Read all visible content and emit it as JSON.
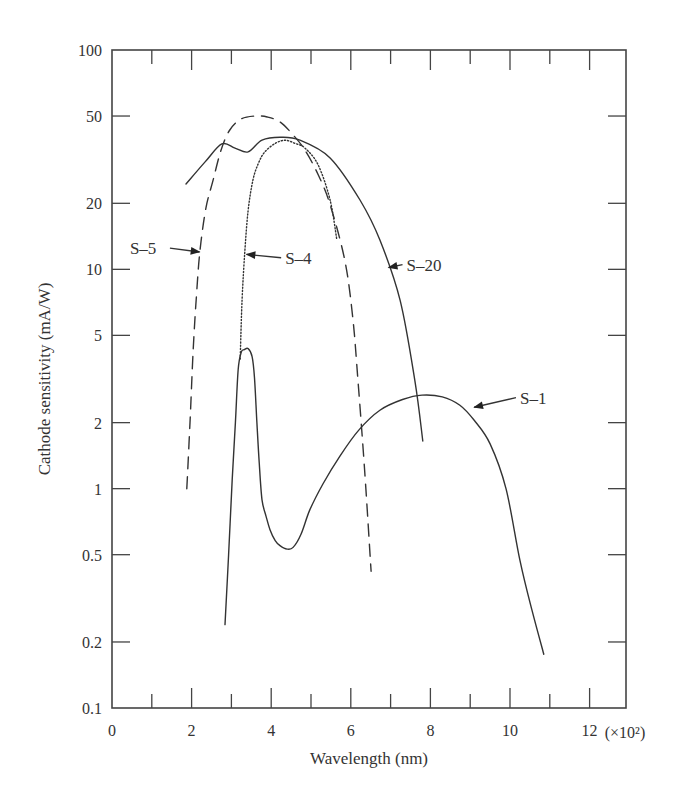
{
  "chart_data": {
    "type": "line",
    "title": "",
    "xlabel": "Wavelength (nm)",
    "x_multiplier_label": "(×10²)",
    "ylabel": "Cathode sensitivity (mA/W)",
    "xlim": [
      0,
      12.8
    ],
    "ylim": [
      0.1,
      100
    ],
    "yscale": "log",
    "grid": false,
    "x_ticks": [
      0,
      2,
      4,
      6,
      8,
      10,
      12
    ],
    "x_tick_labels": [
      "0",
      "2",
      "4",
      "6",
      "8",
      "10",
      "12"
    ],
    "x_minor_ticks": [
      1,
      3,
      5,
      7,
      9,
      11
    ],
    "y_ticks": [
      0.1,
      0.2,
      0.5,
      1,
      2,
      5,
      10,
      20,
      50,
      100
    ],
    "y_tick_labels": [
      "0.1",
      "0.2",
      "0.5",
      "1",
      "2",
      "5",
      "10",
      "20",
      "50",
      "100"
    ],
    "series": [
      {
        "name": "S-20",
        "style": "solid",
        "x": [
          1.86,
          2.34,
          2.76,
          3.09,
          3.42,
          3.77,
          4.22,
          4.72,
          5.48,
          6.23,
          6.73,
          7.24,
          7.61,
          7.81
        ],
        "values": [
          24.5,
          30.9,
          37.3,
          35.7,
          34.3,
          38.8,
          40.0,
          38.8,
          32.2,
          20.7,
          13.6,
          7.2,
          3.1,
          1.65
        ],
        "label_pos": [
          7.4,
          10.5
        ],
        "arrow_to": [
          6.95,
          10.2
        ]
      },
      {
        "name": "S-5",
        "style": "dashed",
        "x": [
          1.88,
          1.96,
          2.04,
          2.12,
          2.21,
          2.36,
          2.54,
          2.74,
          2.96,
          3.25,
          3.59,
          3.9,
          4.22,
          4.55,
          4.85,
          5.18,
          5.48,
          5.85,
          6.05,
          6.18,
          6.35,
          6.51
        ],
        "values": [
          1.0,
          2.0,
          4.3,
          7.5,
          12.2,
          19.0,
          25.5,
          35.0,
          43.2,
          48.5,
          50.0,
          49.5,
          47.0,
          41.0,
          34.9,
          27.0,
          19.7,
          11.0,
          6.0,
          3.1,
          1.2,
          0.42
        ],
        "label_pos": [
          0.45,
          12.5
        ],
        "arrow_to": [
          2.2,
          12.0
        ]
      },
      {
        "name": "S-4",
        "style": "dotted",
        "x": [
          3.22,
          3.27,
          3.34,
          3.42,
          3.54,
          3.68,
          3.84,
          4.1,
          4.35,
          4.6,
          4.85,
          5.18,
          5.48,
          5.65
        ],
        "values": [
          3.9,
          7.3,
          12.2,
          18.5,
          25.5,
          30.5,
          34.3,
          37.5,
          38.8,
          37.5,
          35.7,
          29.9,
          20.7,
          13.6
        ],
        "label_pos": [
          4.35,
          11.3
        ],
        "arrow_to": [
          3.38,
          11.7
        ]
      },
      {
        "name": "S-1",
        "style": "solid",
        "x": [
          2.84,
          2.93,
          3.02,
          3.1,
          3.17,
          3.25,
          3.32,
          3.42,
          3.52,
          3.58,
          3.64,
          3.7,
          3.77,
          3.87,
          3.97,
          4.1,
          4.22,
          4.4,
          4.55,
          4.75,
          4.97,
          5.3,
          5.73,
          6.2,
          6.73,
          7.3,
          7.79,
          8.3,
          8.74,
          9.1,
          9.5,
          9.9,
          10.25,
          10.55,
          10.85
        ],
        "values": [
          0.24,
          0.5,
          1.1,
          2.0,
          3.5,
          4.2,
          4.3,
          4.35,
          4.0,
          3.2,
          2.0,
          1.3,
          0.89,
          0.75,
          0.65,
          0.58,
          0.55,
          0.53,
          0.54,
          0.62,
          0.8,
          1.05,
          1.41,
          1.85,
          2.28,
          2.55,
          2.67,
          2.62,
          2.4,
          2.05,
          1.6,
          1.0,
          0.47,
          0.28,
          0.176
        ],
        "label_pos": [
          10.25,
          2.6
        ],
        "arrow_to": [
          9.1,
          2.35
        ]
      }
    ]
  }
}
